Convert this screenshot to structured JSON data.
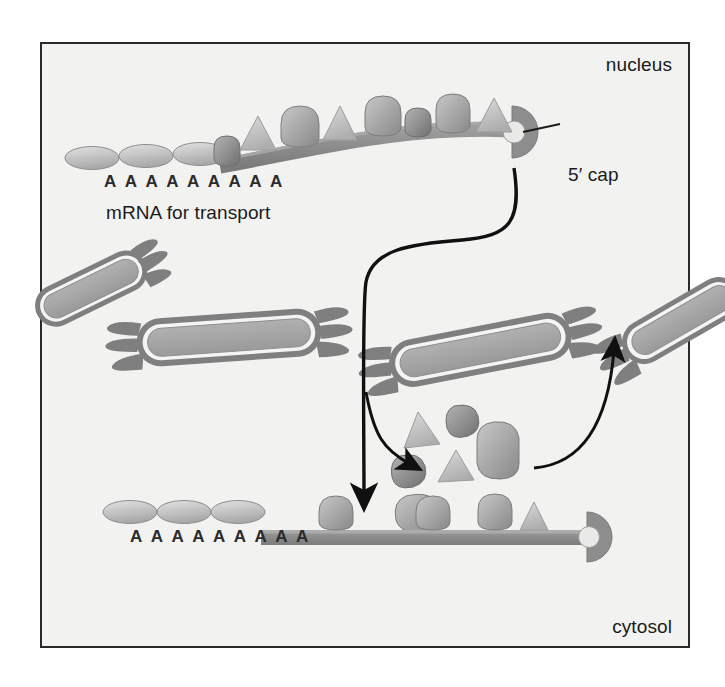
{
  "figure": {
    "background": "#f2f2f0",
    "border_color": "#2a2a2a"
  },
  "labels": {
    "nucleus": "nucleus",
    "cytosol": "cytosol",
    "mrna_for_transport": "mRNA for transport",
    "five_prime_cap": "5′ cap",
    "poly_a_tail_top": "A A A A A A A A A",
    "poly_a_tail_bottom": "A A A A A A A A A"
  },
  "colors": {
    "strand_dark": "#8a8a8a",
    "strand_light": "#a8a8a8",
    "protein_dark": "#8c8c8c",
    "protein_mid": "#9e9e9e",
    "protein_light": "#c2c2c2",
    "triangle_light": "#c9c9c9",
    "pore_outer": "#8b8b8b",
    "pore_rim": "#f4f4f2",
    "pore_fill": "#a6a6a6",
    "arrow": "#101010",
    "text": "#1b1b1b"
  },
  "top_mrna": {
    "name": "nuclear mRNA with bound proteins",
    "poly_a_ellipses": 3,
    "bound_particles": [
      {
        "kind": "blob",
        "tone": "dark"
      },
      {
        "kind": "triangle",
        "tone": "light"
      },
      {
        "kind": "blob",
        "tone": "mid"
      },
      {
        "kind": "triangle",
        "tone": "light"
      },
      {
        "kind": "blob",
        "tone": "mid"
      },
      {
        "kind": "blob",
        "tone": "dark"
      },
      {
        "kind": "blob",
        "tone": "mid"
      },
      {
        "kind": "triangle",
        "tone": "light"
      },
      {
        "kind": "triangle",
        "tone": "light"
      },
      {
        "kind": "triangle",
        "tone": "light"
      }
    ],
    "cap_shape": "semicircle"
  },
  "bottom_mrna": {
    "name": "cytosolic mRNA with few remaining proteins",
    "poly_a_ellipses": 3,
    "bound_particles": [
      {
        "kind": "blob",
        "tone": "mid"
      },
      {
        "kind": "blob",
        "tone": "mid"
      },
      {
        "kind": "blob",
        "tone": "mid"
      },
      {
        "kind": "triangle",
        "tone": "light"
      }
    ],
    "cap_shape": "semicircle"
  },
  "nuclear_pores": [
    {
      "name": "pore-left-edge",
      "position": "left edge, angled"
    },
    {
      "name": "pore-left-center",
      "position": "left of center"
    },
    {
      "name": "pore-right-center",
      "position": "right of center"
    },
    {
      "name": "pore-right-edge",
      "position": "right edge, angled"
    }
  ],
  "released_proteins": [
    {
      "kind": "triangle",
      "tone": "light"
    },
    {
      "kind": "blob",
      "tone": "dark"
    },
    {
      "kind": "blob",
      "tone": "dark"
    },
    {
      "kind": "triangle",
      "tone": "light"
    },
    {
      "kind": "blob",
      "tone": "mid"
    },
    {
      "kind": "blob",
      "tone": "mid"
    }
  ],
  "arrows": [
    {
      "name": "export-arrow",
      "from": "5′ cap of nuclear mRNA",
      "to": "cytosol",
      "style": "long S-curve down"
    },
    {
      "name": "protein-release-arrow",
      "from": "mRNA export path",
      "to": "released protein pool"
    },
    {
      "name": "protein-reimport-arrow",
      "from": "released protein pool",
      "to": "nuclear pore"
    }
  ]
}
